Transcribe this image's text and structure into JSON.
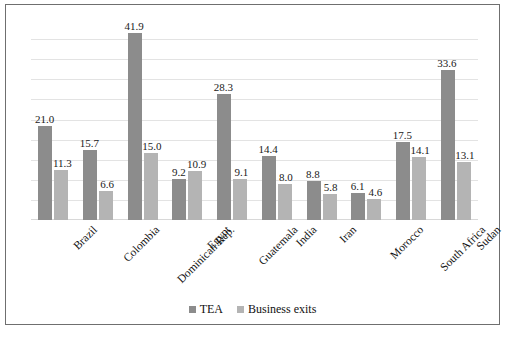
{
  "chart_data": {
    "type": "bar",
    "title": "",
    "xlabel": "",
    "ylabel": "",
    "ylim": [
      0,
      45
    ],
    "grid": true,
    "legend_position": "bottom-center",
    "categories": [
      "Brazil",
      "Colombia",
      "Dominican Rep.",
      "Egypt",
      "Guatemala",
      "India",
      "Iran",
      "Morocco",
      "South Africa",
      "Sudan"
    ],
    "series": [
      {
        "name": "TEA",
        "color": "#8c8c8c",
        "values": [
          21.0,
          15.7,
          41.9,
          9.2,
          28.3,
          14.4,
          8.8,
          6.1,
          17.5,
          33.6
        ],
        "labels": [
          "21.0",
          "15.7",
          "41.9",
          "9.2",
          "28.3",
          "14.4",
          "8.8",
          "6.1",
          "17.5",
          "33.6"
        ]
      },
      {
        "name": "Business exits",
        "color": "#b4b4b4",
        "values": [
          11.3,
          6.6,
          15.0,
          10.9,
          9.1,
          8.0,
          5.8,
          4.6,
          14.1,
          13.1
        ],
        "labels": [
          "11.3",
          "6.6",
          "15.0",
          "10.9",
          "9.1",
          "8.0",
          "5.8",
          "4.6",
          "14.1",
          "13.1"
        ]
      }
    ],
    "gridline_count": 9
  },
  "legend": {
    "items": [
      {
        "label": "TEA",
        "color": "#8c8c8c"
      },
      {
        "label": "Business exits",
        "color": "#b4b4b4"
      }
    ]
  },
  "colors": {
    "series_tea": "#8c8c8c",
    "series_exits": "#b4b4b4",
    "gridline": "#e3e3e3",
    "frame": "#6f6f6f",
    "text": "#111111",
    "background": "#ffffff"
  }
}
